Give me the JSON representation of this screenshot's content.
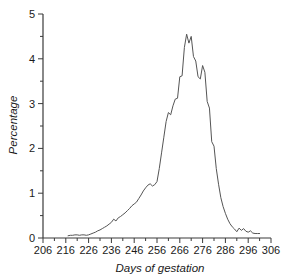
{
  "chart_data": {
    "type": "line",
    "title": "",
    "subtitle": "",
    "xlabel": "Days of gestation",
    "ylabel": "Percentage",
    "xlim": [
      206,
      306
    ],
    "ylim": [
      0,
      5
    ],
    "xticks": [
      206,
      216,
      226,
      236,
      246,
      256,
      266,
      276,
      286,
      296,
      306
    ],
    "yticks": [
      0,
      1,
      2,
      3,
      4,
      5
    ],
    "x_minor_tick_step": 5,
    "y_minor_tick_step": 0.5,
    "grid": false,
    "legend": null,
    "legend_position": "none",
    "line_color": "#555555",
    "line_width": 1,
    "annotations": [],
    "series": [
      {
        "name": "Percentage of births",
        "x": [
          217,
          218,
          219,
          220,
          221,
          222,
          223,
          224,
          225,
          226,
          227,
          228,
          229,
          230,
          231,
          232,
          233,
          234,
          235,
          236,
          237,
          238,
          239,
          240,
          241,
          242,
          243,
          244,
          245,
          246,
          247,
          248,
          249,
          250,
          251,
          252,
          253,
          254,
          255,
          256,
          257,
          258,
          259,
          260,
          261,
          262,
          263,
          264,
          265,
          266,
          267,
          268,
          269,
          270,
          271,
          272,
          273,
          274,
          275,
          276,
          277,
          278,
          279,
          280,
          281,
          282,
          283,
          284,
          285,
          286,
          287,
          288,
          289,
          290,
          291,
          292,
          293,
          294,
          295,
          296,
          297,
          298,
          299,
          300,
          301
        ],
        "values": [
          0.05,
          0.06,
          0.06,
          0.07,
          0.07,
          0.06,
          0.07,
          0.07,
          0.06,
          0.07,
          0.09,
          0.11,
          0.13,
          0.16,
          0.18,
          0.21,
          0.24,
          0.27,
          0.31,
          0.35,
          0.42,
          0.38,
          0.45,
          0.48,
          0.52,
          0.56,
          0.61,
          0.66,
          0.72,
          0.76,
          0.8,
          0.88,
          0.96,
          1.05,
          1.12,
          1.18,
          1.21,
          1.16,
          1.19,
          1.26,
          1.55,
          1.9,
          2.25,
          2.6,
          2.8,
          2.75,
          2.95,
          3.1,
          3.12,
          3.6,
          3.62,
          4.25,
          4.55,
          4.35,
          4.5,
          4.05,
          3.95,
          3.6,
          3.55,
          3.85,
          3.7,
          3.05,
          2.9,
          2.15,
          2.05,
          1.55,
          1.2,
          0.9,
          0.7,
          0.55,
          0.42,
          0.32,
          0.25,
          0.2,
          0.14,
          0.22,
          0.17,
          0.21,
          0.15,
          0.13,
          0.16,
          0.11,
          0.1,
          0.1,
          0.1
        ]
      }
    ]
  }
}
